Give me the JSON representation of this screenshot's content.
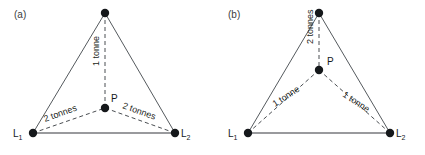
{
  "figure": {
    "background": "#ffffff",
    "stroke_solid": "#555a5e",
    "stroke_dashed": "#4a4e52",
    "node_color": "#15181b"
  },
  "panels": [
    {
      "id": "a",
      "label": "(a)",
      "label_x": 14,
      "label_y": 18,
      "nodes": {
        "apex": {
          "x": 105,
          "y": 13,
          "r": 4.2
        },
        "left": {
          "x": 33,
          "y": 133,
          "r": 4.2
        },
        "right": {
          "x": 175,
          "y": 133,
          "r": 4.2
        },
        "p": {
          "x": 105,
          "y": 108,
          "r": 4.2
        }
      },
      "vertex_labels": {
        "left_base": "L",
        "left_sub": "1",
        "right_base": "L",
        "right_sub": "2",
        "point": "P"
      },
      "label_positions": {
        "left_x": 13,
        "left_y": 137,
        "right_x": 181,
        "right_y": 137,
        "point_x": 111,
        "point_y": 102
      },
      "measures": [
        {
          "name": "vertical",
          "text": "1 tonne",
          "x": 99,
          "y": 66,
          "rotate": -90
        },
        {
          "name": "left",
          "text": "2 tonnes",
          "x": 45,
          "y": 122,
          "rotate": -20
        },
        {
          "name": "right",
          "text": "2 tonnes",
          "x": 122,
          "y": 108,
          "rotate": 20
        }
      ]
    },
    {
      "id": "b",
      "label": "(b)",
      "label_x": 228,
      "label_y": 18,
      "nodes": {
        "apex": {
          "x": 319,
          "y": 13,
          "r": 4.2
        },
        "left": {
          "x": 248,
          "y": 133,
          "r": 4.2
        },
        "right": {
          "x": 390,
          "y": 133,
          "r": 4.2
        },
        "p": {
          "x": 319,
          "y": 70,
          "r": 4.2
        }
      },
      "vertex_labels": {
        "left_base": "L",
        "left_sub": "1",
        "right_base": "L",
        "right_sub": "2",
        "point": "P"
      },
      "label_positions": {
        "left_x": 228,
        "left_y": 137,
        "right_x": 396,
        "right_y": 137,
        "point_x": 327,
        "point_y": 65
      },
      "measures": [
        {
          "name": "vertical",
          "text": "2 tonnes",
          "x": 313,
          "y": 44,
          "rotate": -90
        },
        {
          "name": "left",
          "text": "1 tonne",
          "x": 275,
          "y": 107,
          "rotate": -33
        },
        {
          "name": "right",
          "text": "1 tonne",
          "x": 342,
          "y": 96,
          "rotate": 33
        }
      ]
    }
  ]
}
